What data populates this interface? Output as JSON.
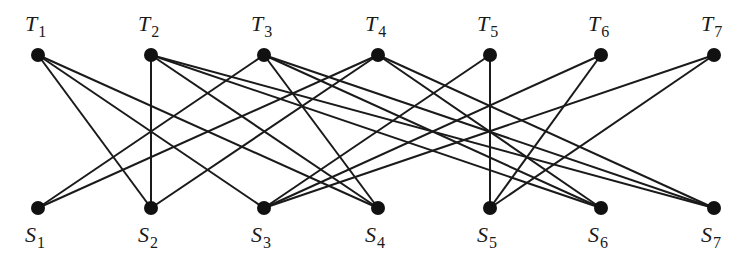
{
  "diagram": {
    "type": "bipartite-graph",
    "top_nodes": [
      {
        "id": "T1",
        "letter": "T",
        "sub": "1",
        "x": 38,
        "y": 55
      },
      {
        "id": "T2",
        "letter": "T",
        "sub": "2",
        "x": 151,
        "y": 55
      },
      {
        "id": "T3",
        "letter": "T",
        "sub": "3",
        "x": 264,
        "y": 55
      },
      {
        "id": "T4",
        "letter": "T",
        "sub": "4",
        "x": 378,
        "y": 55
      },
      {
        "id": "T5",
        "letter": "T",
        "sub": "5",
        "x": 490,
        "y": 55
      },
      {
        "id": "T6",
        "letter": "T",
        "sub": "6",
        "x": 601,
        "y": 55
      },
      {
        "id": "T7",
        "letter": "T",
        "sub": "7",
        "x": 714,
        "y": 55
      }
    ],
    "bottom_nodes": [
      {
        "id": "S1",
        "letter": "S",
        "sub": "1",
        "x": 38,
        "y": 208
      },
      {
        "id": "S2",
        "letter": "S",
        "sub": "2",
        "x": 151,
        "y": 208
      },
      {
        "id": "S3",
        "letter": "S",
        "sub": "3",
        "x": 264,
        "y": 208
      },
      {
        "id": "S4",
        "letter": "S",
        "sub": "4",
        "x": 378,
        "y": 208
      },
      {
        "id": "S5",
        "letter": "S",
        "sub": "5",
        "x": 490,
        "y": 208
      },
      {
        "id": "S6",
        "letter": "S",
        "sub": "6",
        "x": 601,
        "y": 208
      },
      {
        "id": "S7",
        "letter": "S",
        "sub": "7",
        "x": 714,
        "y": 208
      }
    ],
    "edges": [
      [
        "T1",
        "S2"
      ],
      [
        "T1",
        "S3"
      ],
      [
        "T1",
        "S4"
      ],
      [
        "T2",
        "S2"
      ],
      [
        "T2",
        "S4"
      ],
      [
        "T2",
        "S6"
      ],
      [
        "T2",
        "S7"
      ],
      [
        "T3",
        "S1"
      ],
      [
        "T3",
        "S4"
      ],
      [
        "T3",
        "S6"
      ],
      [
        "T3",
        "S7"
      ],
      [
        "T4",
        "S1"
      ],
      [
        "T4",
        "S2"
      ],
      [
        "T4",
        "S6"
      ],
      [
        "T4",
        "S7"
      ],
      [
        "T5",
        "S3"
      ],
      [
        "T5",
        "S5"
      ],
      [
        "T6",
        "S3"
      ],
      [
        "T6",
        "S5"
      ],
      [
        "T7",
        "S3"
      ],
      [
        "T7",
        "S5"
      ]
    ],
    "colors": {
      "edge": "#1a1a1a",
      "node": "#111111",
      "label": "#1a1a1a",
      "background": "#ffffff"
    }
  }
}
